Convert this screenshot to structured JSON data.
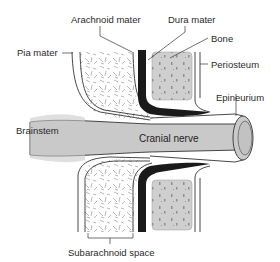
{
  "diagram": {
    "title": "",
    "labels": {
      "arachnoid_mater": "Arachnoid mater",
      "dura_mater": "Dura mater",
      "bone": "Bone",
      "pia_mater": "Pia mater",
      "periosteum": "Periosteum",
      "epineurium": "Epineurium",
      "brainstem": "Brainstem",
      "cranial_nerve": "Cranial nerve",
      "subarachnoid_space": "Subarachnoid space"
    },
    "colors": {
      "nerve_fill": "#c9c9c9",
      "bone_fill": "#cfcfcf",
      "dura_fill": "#1a1a1a",
      "outline": "#333333",
      "trabeculae": "#8a8a8a",
      "background": "#ffffff"
    }
  }
}
